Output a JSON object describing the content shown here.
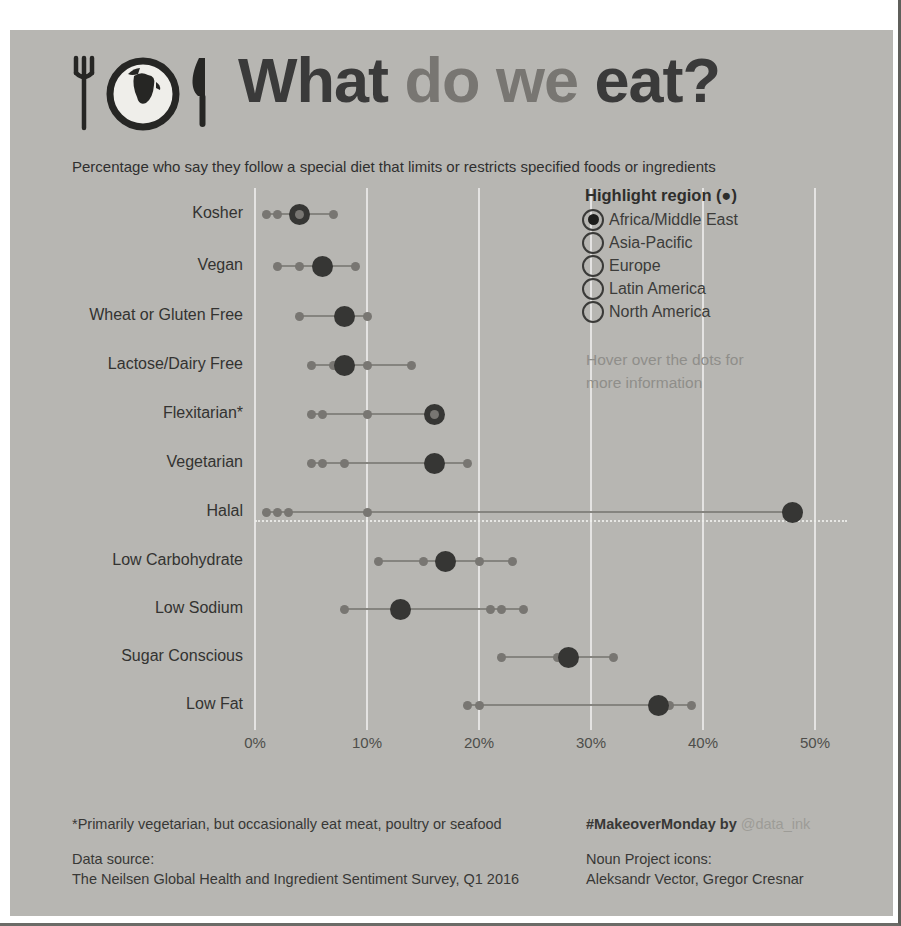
{
  "header": {
    "title_part1": "What",
    "title_part2": "do we",
    "title_part3": "eat?",
    "subtitle": "Percentage who say they follow a special diet that limits or restricts specified foods or ingredients"
  },
  "legend": {
    "title": "Highlight region (●)",
    "options": [
      {
        "label": "Africa/Middle East",
        "selected": true
      },
      {
        "label": "Asia-Pacific",
        "selected": false
      },
      {
        "label": "Europe",
        "selected": false
      },
      {
        "label": "Latin America",
        "selected": false
      },
      {
        "label": "North America",
        "selected": false
      }
    ],
    "hover_note_line1": "Hover over the dots for",
    "hover_note_line2": "more information"
  },
  "chart_data": {
    "type": "scatter",
    "title": "What do we eat?",
    "xlabel": "Percent following diet",
    "x_axis": {
      "min": 0,
      "max": 50,
      "tick_labels": [
        "0%",
        "10%",
        "20%",
        "30%",
        "40%",
        "50%"
      ],
      "grid": true
    },
    "highlight_region": "Africa/Middle East",
    "rows": [
      {
        "label": "Kosher",
        "other_values": [
          1,
          2,
          7
        ],
        "highlight_value": 4,
        "overlap_on_highlight": true,
        "reference_line": false
      },
      {
        "label": "Vegan",
        "other_values": [
          2,
          4,
          9
        ],
        "highlight_value": 6,
        "overlap_on_highlight": false,
        "reference_line": false
      },
      {
        "label": "Wheat or Gluten Free",
        "other_values": [
          4,
          10
        ],
        "highlight_value": 8,
        "overlap_on_highlight": false,
        "reference_line": false
      },
      {
        "label": "Lactose/Dairy Free",
        "other_values": [
          5,
          7,
          10,
          14
        ],
        "highlight_value": 8,
        "overlap_on_highlight": false,
        "reference_line": false
      },
      {
        "label": "Flexitarian*",
        "other_values": [
          5,
          6,
          10
        ],
        "highlight_value": 16,
        "overlap_on_highlight": true,
        "reference_line": false
      },
      {
        "label": "Vegetarian",
        "other_values": [
          5,
          6,
          8,
          19
        ],
        "highlight_value": 16,
        "overlap_on_highlight": false,
        "reference_line": false
      },
      {
        "label": "Halal",
        "other_values": [
          1,
          2,
          3,
          10
        ],
        "highlight_value": 48,
        "overlap_on_highlight": false,
        "reference_line": true
      },
      {
        "label": "Low Carbohydrate",
        "other_values": [
          11,
          15,
          20,
          23
        ],
        "highlight_value": 17,
        "overlap_on_highlight": false,
        "reference_line": false
      },
      {
        "label": "Low Sodium",
        "other_values": [
          8,
          21,
          22,
          24
        ],
        "highlight_value": 13,
        "overlap_on_highlight": false,
        "reference_line": false
      },
      {
        "label": "Sugar Conscious",
        "other_values": [
          22,
          27,
          32
        ],
        "highlight_value": 28,
        "overlap_on_highlight": false,
        "reference_line": false
      },
      {
        "label": "Low Fat",
        "other_values": [
          19,
          20,
          37,
          39
        ],
        "highlight_value": 36,
        "overlap_on_highlight": false,
        "reference_line": false
      }
    ]
  },
  "colors": {
    "page_background": "#b7b6b2",
    "highlight_dot": "#363634",
    "other_dot": "#787672",
    "connector_line": "#85847f",
    "gridline": "#e8e8e4"
  },
  "footer": {
    "flexitarian_note": "*Primarily vegetarian, but occasionally eat meat, poultry or seafood",
    "data_source_label": "Data source:",
    "data_source_value": "The Neilsen Global Health and Ingredient Sentiment Survey, Q1 2016",
    "makeover_prefix": "#MakeoverMonday by",
    "makeover_handle": "@data_ink",
    "icons_label": "Noun Project icons:",
    "icons_value": "Aleksandr Vector, Gregor Cresnar"
  }
}
